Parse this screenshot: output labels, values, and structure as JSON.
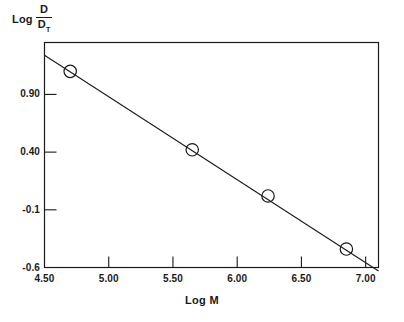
{
  "chart_data": {
    "type": "scatter",
    "title": "",
    "xlabel": "Log M",
    "ylabel": "Log D/D_T",
    "ylabel_parts": {
      "word": "Log",
      "numerator": "D",
      "denominator": "D",
      "denominator_sub": "T"
    },
    "xlim": [
      4.5,
      7.1
    ],
    "ylim": [
      -0.6,
      1.35
    ],
    "xticks": [
      4.5,
      5.0,
      5.5,
      6.0,
      6.5,
      7.0
    ],
    "xtick_labels": [
      "4.50",
      "5.00",
      "5.50",
      "6.00",
      "6.50",
      "7.00"
    ],
    "yticks": [
      0.9,
      0.4,
      -0.1,
      -0.6
    ],
    "ytick_labels": [
      "0.90",
      "0.40",
      "-0.1",
      "-0.6"
    ],
    "grid": false,
    "legend": null,
    "marker": "open-circle",
    "line_color": "#1a1a1a",
    "frame_color": "#1a1a1a",
    "background": "#ffffff",
    "points": [
      {
        "x": 4.7,
        "y": 1.1
      },
      {
        "x": 5.65,
        "y": 0.42
      },
      {
        "x": 6.24,
        "y": 0.02
      },
      {
        "x": 6.85,
        "y": -0.44
      }
    ],
    "fit_line": {
      "x_start": 4.5,
      "y_start": 1.24,
      "x_end": 7.1,
      "y_end": -0.63,
      "slope": -0.72,
      "intercept": 4.48
    }
  }
}
